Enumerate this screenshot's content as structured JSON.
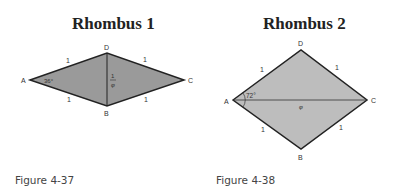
{
  "figures": [
    {
      "title": "Rhombus 1",
      "caption": "Figure 4-37",
      "vertices": {
        "A": "A",
        "B": "B",
        "C": "C",
        "D": "D"
      },
      "side_labels": [
        "1",
        "1",
        "1",
        "1"
      ],
      "angle_label": "36°",
      "diagonal_label_num": "1",
      "diagonal_label_den": "φ",
      "fill": "#9a9a9a"
    },
    {
      "title": "Rhombus 2",
      "caption": "Figure 4-38",
      "vertices": {
        "A": "A",
        "B": "B",
        "C": "C",
        "D": "D"
      },
      "side_labels": [
        "1",
        "1",
        "1",
        "1"
      ],
      "angle_label": "72°",
      "diagonal_label": "φ",
      "fill": "#bdbdbd"
    }
  ]
}
